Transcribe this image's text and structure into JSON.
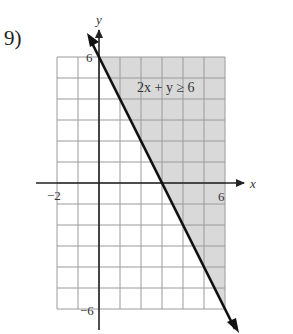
{
  "problem": {
    "number_label": "9)"
  },
  "chart_data": {
    "type": "line",
    "title": "",
    "inequality": "2x + y ≥ 6",
    "boundary_line": {
      "equation": "2x + y = 6",
      "style": "solid",
      "points": [
        [
          0,
          6
        ],
        [
          3,
          0
        ]
      ],
      "slope": -2,
      "y_intercept": 6
    },
    "shaded_region": "above/right of line (2x + y ≥ 6)",
    "xlabel": "x",
    "ylabel": "y",
    "xlim": [
      -2,
      6
    ],
    "ylim": [
      -6,
      6
    ],
    "x_tick_labels": [
      "-2",
      "6"
    ],
    "y_tick_labels": [
      "6",
      "-6"
    ],
    "grid": true,
    "grid_step": 1
  },
  "labels": {
    "x_axis": "x",
    "y_axis": "y",
    "x_min": "−2",
    "x_max": "6",
    "y_max": "6",
    "y_min": "−6",
    "inequality_lhs": "2x + y ≥ 6"
  },
  "colors": {
    "shade": "#d9d9d9",
    "grid": "#9a9a9a",
    "axis": "#222222",
    "line": "#111111"
  }
}
